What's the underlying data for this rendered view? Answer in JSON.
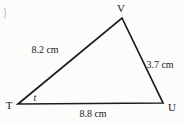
{
  "figure": {
    "shape": "triangle",
    "vertices": {
      "top": {
        "label": "V"
      },
      "bottom_left": {
        "label": "T"
      },
      "bottom_right": {
        "label": "U"
      }
    },
    "sides": {
      "left": {
        "from": "T",
        "to": "V",
        "label": "8.2 cm"
      },
      "right": {
        "from": "V",
        "to": "U",
        "label": "3.7 cm"
      },
      "bottom": {
        "from": "T",
        "to": "U",
        "label": "8.8 cm"
      }
    },
    "angles": {
      "at_bottom_left": {
        "vertex": "T",
        "label": "t"
      }
    },
    "colors": {
      "line": "#1b1b1b",
      "text": "#1b1b1b",
      "background": "#fcfcfa"
    }
  }
}
